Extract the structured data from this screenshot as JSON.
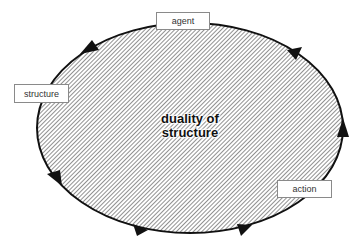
{
  "diagram": {
    "title_line1": "duality of",
    "title_line2": "structure",
    "labels": {
      "agent": "agent",
      "structure": "structure",
      "action": "action"
    },
    "flow_direction": "counter-clockwise",
    "arrow_count": 6,
    "colors": {
      "outline": "#111111",
      "hatch": "#555555",
      "background": "#ffffff",
      "box_border": "#8a8a8a"
    }
  }
}
